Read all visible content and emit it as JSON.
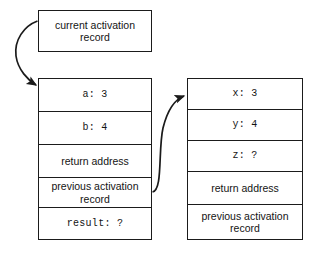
{
  "diagram": {
    "title_box": {
      "label": "current activation record",
      "line1": "current activation",
      "line2": "record"
    },
    "left_stack": {
      "name": "current activation record frame",
      "cells": [
        {
          "text": "a: 3",
          "style": "mono"
        },
        {
          "text": "b: 4",
          "style": "mono"
        },
        {
          "text": "return address",
          "style": "sans"
        },
        {
          "text": "previous activation record",
          "style": "sans"
        },
        {
          "text": "result: ?",
          "style": "mono"
        }
      ]
    },
    "right_stack": {
      "name": "callee activation record frame",
      "cells": [
        {
          "text": "x: 3",
          "style": "mono"
        },
        {
          "text": "y: 4",
          "style": "mono"
        },
        {
          "text": "z: ?",
          "style": "mono"
        },
        {
          "text": "return address",
          "style": "sans"
        },
        {
          "text": "previous activation record",
          "style": "sans"
        }
      ]
    },
    "arrows": [
      {
        "name": "current-record-pointer-arrow",
        "from": "current activation record box",
        "to": "left stack top cell"
      },
      {
        "name": "previous-record-link-arrow",
        "from": "left stack previous activation record cell",
        "to": "right stack top cell"
      }
    ],
    "colors": {
      "stroke": "#1b1b1b",
      "background": "#ffffff",
      "text": "#141414"
    }
  }
}
